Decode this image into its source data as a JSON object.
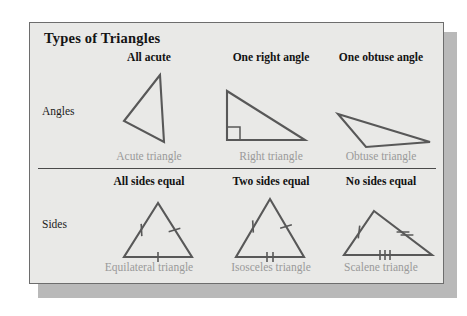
{
  "panel": {
    "title": "Types of Triangles",
    "background_color": "#e9e9e7",
    "border_color": "#6d6d6d",
    "shadow_color": "#b9b9b9"
  },
  "colors": {
    "heading_text": "#121212",
    "caption_text": "#9a9a9a",
    "figure_stroke": "#585858",
    "divider": "#4a4a4a"
  },
  "rows": [
    {
      "label": "Angles",
      "columns": [
        {
          "heading": "All acute",
          "caption": "Acute triangle",
          "figure": "acute-triangle",
          "marks": "none"
        },
        {
          "heading": "One right angle",
          "caption": "Right triangle",
          "figure": "right-triangle",
          "marks": "right-angle-square"
        },
        {
          "heading": "One obtuse angle",
          "caption": "Obtuse triangle",
          "figure": "obtuse-triangle",
          "marks": "none"
        }
      ]
    },
    {
      "label": "Sides",
      "columns": [
        {
          "heading": "All sides equal",
          "caption": "Equilateral triangle",
          "figure": "equilateral-triangle",
          "marks": "tick-1-1-1"
        },
        {
          "heading": "Two sides equal",
          "caption": "Isosceles triangle",
          "figure": "isosceles-triangle",
          "marks": "tick-1-1-2"
        },
        {
          "heading": "No sides equal",
          "caption": "Scalene triangle",
          "figure": "scalene-triangle",
          "marks": "tick-1-2-3"
        }
      ]
    }
  ]
}
